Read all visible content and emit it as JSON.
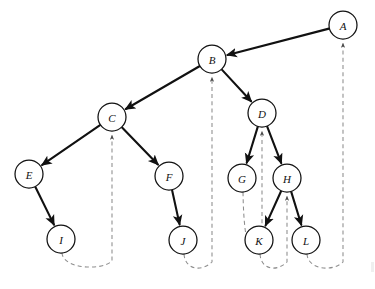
{
  "figure": {
    "width": 375,
    "height": 289,
    "background_color": "#ffffff"
  },
  "style": {
    "node_fill": "#ffffff",
    "node_stroke": "#111111",
    "node_radius": 14,
    "tree_edge_color": "#111111",
    "back_edge_color": "#8d8d8d",
    "label_color": "#111111"
  },
  "nodes": [
    {
      "id": "A",
      "label": "A",
      "x": 343,
      "y": 25
    },
    {
      "id": "B",
      "label": "B",
      "x": 212,
      "y": 59
    },
    {
      "id": "C",
      "label": "C",
      "x": 112,
      "y": 117
    },
    {
      "id": "D",
      "label": "D",
      "x": 262,
      "y": 113
    },
    {
      "id": "E",
      "label": "E",
      "x": 29,
      "y": 174
    },
    {
      "id": "F",
      "label": "F",
      "x": 169,
      "y": 176
    },
    {
      "id": "G",
      "label": "G",
      "x": 242,
      "y": 178
    },
    {
      "id": "H",
      "label": "H",
      "x": 287,
      "y": 178
    },
    {
      "id": "I",
      "label": "I",
      "x": 61,
      "y": 239
    },
    {
      "id": "J",
      "label": "J",
      "x": 183,
      "y": 240
    },
    {
      "id": "K",
      "label": "K",
      "x": 259,
      "y": 240
    },
    {
      "id": "L",
      "label": "L",
      "x": 306,
      "y": 240
    }
  ],
  "tree_edges": [
    {
      "from": "A",
      "to": "B"
    },
    {
      "from": "B",
      "to": "C"
    },
    {
      "from": "B",
      "to": "D"
    },
    {
      "from": "C",
      "to": "E"
    },
    {
      "from": "C",
      "to": "F"
    },
    {
      "from": "D",
      "to": "G"
    },
    {
      "from": "D",
      "to": "H"
    },
    {
      "from": "E",
      "to": "I"
    },
    {
      "from": "F",
      "to": "J"
    },
    {
      "from": "H",
      "to": "K"
    },
    {
      "from": "H",
      "to": "L"
    }
  ],
  "back_edges": [
    {
      "from": "I",
      "to": "C"
    },
    {
      "from": "J",
      "to": "B"
    },
    {
      "from": "G",
      "to": "D"
    },
    {
      "from": "K",
      "to": "H"
    },
    {
      "from": "L",
      "to": "A"
    }
  ],
  "chart_data": {
    "type": "diagram",
    "subtype": "directed-graph-dfs-tree",
    "node_ids": [
      "A",
      "B",
      "C",
      "D",
      "E",
      "F",
      "G",
      "H",
      "I",
      "J",
      "K",
      "L"
    ],
    "node_positions": {
      "A": [
        343,
        25
      ],
      "B": [
        212,
        59
      ],
      "C": [
        112,
        117
      ],
      "D": [
        262,
        113
      ],
      "E": [
        29,
        174
      ],
      "F": [
        169,
        176
      ],
      "G": [
        242,
        178
      ],
      "H": [
        287,
        178
      ],
      "I": [
        61,
        239
      ],
      "J": [
        183,
        240
      ],
      "K": [
        259,
        240
      ],
      "L": [
        306,
        240
      ]
    },
    "solid_directed_edges": [
      [
        "A",
        "B"
      ],
      [
        "B",
        "C"
      ],
      [
        "B",
        "D"
      ],
      [
        "C",
        "E"
      ],
      [
        "C",
        "F"
      ],
      [
        "D",
        "G"
      ],
      [
        "D",
        "H"
      ],
      [
        "E",
        "I"
      ],
      [
        "F",
        "J"
      ],
      [
        "H",
        "K"
      ],
      [
        "H",
        "L"
      ]
    ],
    "dashed_back_edges": [
      [
        "I",
        "C"
      ],
      [
        "J",
        "B"
      ],
      [
        "G",
        "D"
      ],
      [
        "K",
        "H"
      ],
      [
        "L",
        "A"
      ]
    ],
    "legend": [
      {
        "style": "solid-arrow",
        "meaning": "tree edge"
      },
      {
        "style": "dashed-arrow",
        "meaning": "back edge"
      }
    ]
  }
}
